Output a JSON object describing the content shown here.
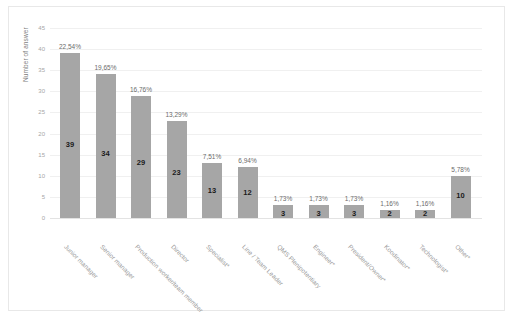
{
  "chart_data": {
    "type": "bar",
    "title": "",
    "xlabel": "",
    "ylabel": "Number of answer",
    "ylim": [
      0,
      45
    ],
    "yticks": [
      0,
      5,
      10,
      15,
      20,
      25,
      30,
      35,
      40,
      45
    ],
    "grid": true,
    "legend": false,
    "bar_color": "#a6a6a6",
    "categories": [
      "Junior manager",
      "Senior manager",
      "Production worker/team member",
      "Director",
      "Specialist*",
      "Line / Team Leader",
      "QMS Plenipotentiary",
      "Engineer*",
      "President/Owner*",
      "Koodinator*",
      "Technologist*",
      "Other*"
    ],
    "values": [
      39,
      34,
      29,
      23,
      13,
      12,
      3,
      3,
      3,
      2,
      2,
      10
    ],
    "value_labels": [
      "39",
      "34",
      "29",
      "23",
      "13",
      "12",
      "3",
      "3",
      "3",
      "2",
      "2",
      "10"
    ],
    "percent_labels": [
      "22,54%",
      "19,65%",
      "16,76%",
      "13,29%",
      "7,51%",
      "6,94%",
      "1,73%",
      "1,73%",
      "1,73%",
      "1,16%",
      "1,16%",
      "5,78%"
    ]
  }
}
